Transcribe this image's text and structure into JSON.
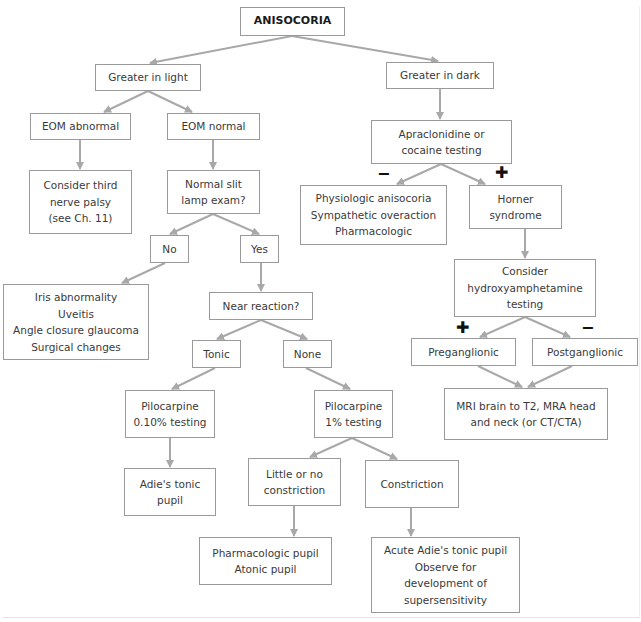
{
  "title": "ANISOCORIA",
  "colors": {
    "edge": "#a8a8a8",
    "border": "#9a9a9a",
    "text": "#3a3a3a",
    "sign": "#111111"
  },
  "nodes": {
    "root": {
      "lines": [
        "ANISOCORIA"
      ]
    },
    "light": {
      "lines": [
        "Greater in light"
      ]
    },
    "dark": {
      "lines": [
        "Greater in dark"
      ]
    },
    "eom_abn": {
      "lines": [
        "EOM abnormal"
      ]
    },
    "eom_norm": {
      "lines": [
        "EOM normal"
      ]
    },
    "apra": {
      "lines": [
        "Apraclonidine or",
        "cocaine testing"
      ]
    },
    "third": {
      "lines": [
        "Consider third",
        "nerve palsy",
        "(see Ch. 11)"
      ]
    },
    "slit": {
      "lines": [
        "Normal slit",
        "lamp exam?"
      ]
    },
    "physio": {
      "lines": [
        "Physiologic anisocoria",
        "Sympathetic overaction",
        "Pharmacologic"
      ]
    },
    "horner": {
      "lines": [
        "Horner",
        "syndrome"
      ]
    },
    "no": {
      "lines": [
        "No"
      ]
    },
    "yes": {
      "lines": [
        "Yes"
      ]
    },
    "iris": {
      "lines": [
        "Iris abnormality",
        "Uveitis",
        "Angle closure glaucoma",
        "Surgical changes"
      ]
    },
    "near": {
      "lines": [
        "Near reaction?"
      ]
    },
    "hydroxy": {
      "lines": [
        "Consider",
        "hydroxyamphetamine",
        "testing"
      ]
    },
    "tonic": {
      "lines": [
        "Tonic"
      ]
    },
    "none": {
      "lines": [
        "None"
      ]
    },
    "pre": {
      "lines": [
        "Preganglionic"
      ]
    },
    "post": {
      "lines": [
        "Postganglionic"
      ]
    },
    "pilo010": {
      "lines": [
        "Pilocarpine",
        "0.10% testing"
      ]
    },
    "pilo1": {
      "lines": [
        "Pilocarpine",
        "1% testing"
      ]
    },
    "mri": {
      "lines": [
        "MRI brain to T2, MRA head",
        "and neck (or CT/CTA)"
      ]
    },
    "adie": {
      "lines": [
        "Adie's tonic",
        "pupil"
      ]
    },
    "little": {
      "lines": [
        "Little or no",
        "constriction"
      ]
    },
    "constr": {
      "lines": [
        "Constriction"
      ]
    },
    "pharm": {
      "lines": [
        "Pharmacologic pupil",
        "Atonic pupil"
      ]
    },
    "acute": {
      "lines": [
        "Acute Adie's tonic pupil",
        "Observe for",
        "development of",
        "supersensitivity"
      ]
    }
  },
  "signs": {
    "apra_minus": "−",
    "apra_plus": "✚",
    "hydroxy_plus": "✚",
    "hydroxy_minus": "−"
  }
}
